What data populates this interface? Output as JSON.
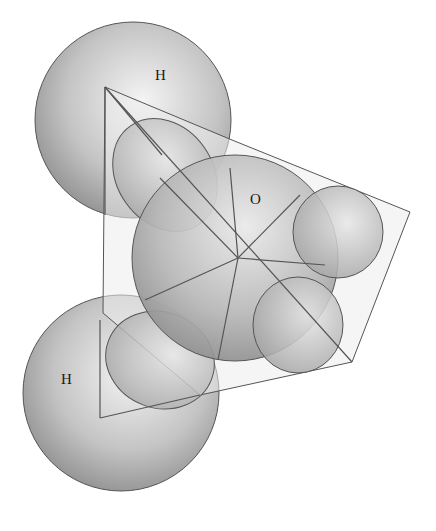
{
  "diagram": {
    "atoms": [
      {
        "id": "hydrogen-top",
        "label": "H",
        "cx": 133,
        "cy": 120,
        "r": 98,
        "label_x": 161,
        "label_y": 80
      },
      {
        "id": "hydrogen-bottom",
        "label": "H",
        "cx": 121,
        "cy": 393,
        "r": 98,
        "label_x": 67,
        "label_y": 384
      },
      {
        "id": "oxygen",
        "label": "O",
        "cx": 235,
        "cy": 258,
        "r": 103,
        "label_x": 256,
        "label_y": 204
      }
    ],
    "colors": {
      "sphere_light": "#f2f2f2",
      "sphere_dark": "#8a8a8a",
      "outline": "#555555",
      "plane_fill": "#eeeeee"
    }
  }
}
